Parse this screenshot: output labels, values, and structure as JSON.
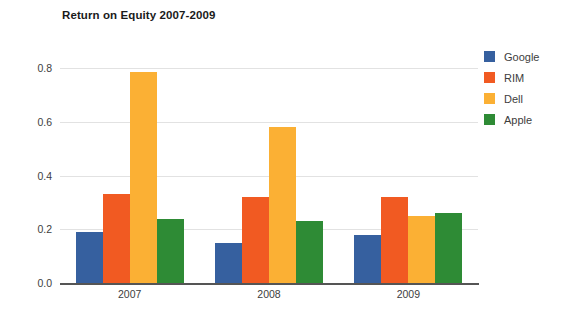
{
  "chart_data": {
    "type": "bar",
    "title": "Return on Equity 2007-2009",
    "xlabel": "",
    "ylabel": "",
    "categories": [
      "2007",
      "2008",
      "2009"
    ],
    "series": [
      {
        "name": "Google",
        "color": "#36609f",
        "values": [
          0.19,
          0.15,
          0.18
        ]
      },
      {
        "name": "RIM",
        "color": "#f15a22",
        "values": [
          0.33,
          0.32,
          0.32
        ]
      },
      {
        "name": "Dell",
        "color": "#fbb034",
        "values": [
          0.785,
          0.58,
          0.25
        ]
      },
      {
        "name": "Apple",
        "color": "#2e8b35",
        "values": [
          0.24,
          0.23,
          0.26
        ]
      }
    ],
    "ylim": [
      0.0,
      0.85
    ],
    "y_ticks": [
      "0.0",
      "0.2",
      "0.4",
      "0.6",
      "0.8"
    ],
    "y_tick_values": [
      0.0,
      0.2,
      0.4,
      0.6,
      0.8
    ],
    "grid": true,
    "legend_position": "right"
  },
  "legend": {
    "items": [
      {
        "label": "Google",
        "color": "#36609f"
      },
      {
        "label": "RIM",
        "color": "#f15a22"
      },
      {
        "label": "Dell",
        "color": "#fbb034"
      },
      {
        "label": "Apple",
        "color": "#2e8b35"
      }
    ]
  },
  "colors": {
    "background": "#ffffff",
    "grid": "#e2e2e2",
    "axis": "#555555",
    "text": "#3d3d3d",
    "title": "#1a1a1a"
  }
}
